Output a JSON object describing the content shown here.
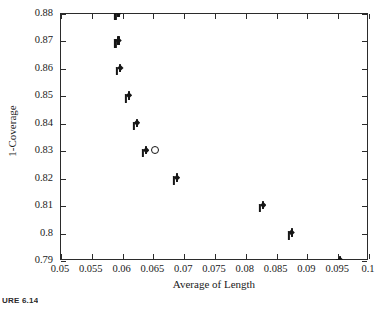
{
  "figure": {
    "caption": "URE 6.14",
    "background": "#ffffff",
    "axis_color": "#2b2b2b",
    "marker_color": "#161616"
  },
  "chart_data": {
    "type": "scatter",
    "title": "",
    "xlabel": "Average of Length",
    "ylabel": "1-Coverage",
    "xlim": [
      0.05,
      0.1
    ],
    "ylim": [
      0.79,
      0.88
    ],
    "grid": false,
    "legend": null,
    "xticks": [
      0.05,
      0.055,
      0.06,
      0.065,
      0.07,
      0.075,
      0.08,
      0.085,
      0.09,
      0.095,
      0.1
    ],
    "xticklabels": [
      "0.05",
      "0.055",
      "0.06",
      "0.065",
      "0.07",
      "0.075",
      "0.08",
      "0.085",
      "0.09",
      "0.095",
      "0.1"
    ],
    "yticks": [
      0.79,
      0.8,
      0.81,
      0.82,
      0.83,
      0.84,
      0.85,
      0.86,
      0.87,
      0.88
    ],
    "yticklabels": [
      "0.79",
      "0.8",
      "0.81",
      "0.82",
      "0.83",
      "0.84",
      "0.85",
      "0.86",
      "0.87",
      "0.88"
    ],
    "series": [
      {
        "name": "methods",
        "marker": "filled-diamond",
        "points": [
          {
            "x": 0.0595,
            "y": 0.88
          },
          {
            "x": 0.0595,
            "y": 0.87
          },
          {
            "x": 0.0598,
            "y": 0.86
          },
          {
            "x": 0.0612,
            "y": 0.85
          },
          {
            "x": 0.0625,
            "y": 0.84
          },
          {
            "x": 0.064,
            "y": 0.83
          },
          {
            "x": 0.069,
            "y": 0.82
          },
          {
            "x": 0.083,
            "y": 0.81
          },
          {
            "x": 0.0876,
            "y": 0.8
          },
          {
            "x": 0.0955,
            "y": 0.79
          }
        ]
      },
      {
        "name": "highlighted",
        "marker": "open-circle",
        "points": [
          {
            "x": 0.0655,
            "y": 0.83
          }
        ]
      }
    ]
  }
}
